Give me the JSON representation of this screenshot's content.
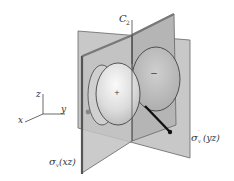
{
  "figure": {
    "labels": {
      "axis_label": "C",
      "axis_sub": "2",
      "plane_xz_sigma": "σ",
      "plane_xz_sub": "v",
      "plane_xz_paren": "(xz)",
      "plane_yz_sigma": "σ",
      "plane_yz_sub": "v",
      "plane_yz_prime": "′",
      "plane_yz_paren": "(yz)",
      "lobe_front_sign": "+",
      "lobe_back_sign": "−",
      "coord_x": "x",
      "coord_y": "y",
      "coord_z": "z"
    },
    "colors": {
      "plane_fill": "#bdbdbd",
      "plane_edge": "#555555",
      "lobe_fill": "#e2e2e2",
      "lobe_back_fill": "#c4c4c4",
      "outline": "#333333"
    }
  }
}
